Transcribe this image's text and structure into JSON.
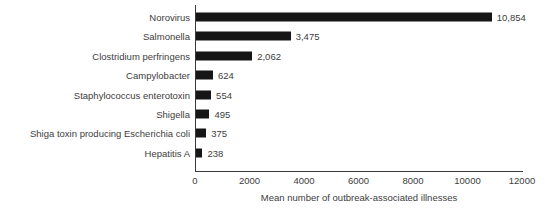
{
  "chart_data": {
    "type": "bar",
    "orientation": "horizontal",
    "title": "",
    "xlabel": "Mean number of outbreak-associated illnesses",
    "ylabel": "",
    "xlim": [
      0,
      12000
    ],
    "xticks": [
      0,
      2000,
      4000,
      6000,
      8000,
      10000,
      12000
    ],
    "xtick_labels": [
      "0",
      "2000",
      "4000",
      "6000",
      "8000",
      "10000",
      "12000"
    ],
    "grid": false,
    "legend": false,
    "bar_color": "#161616",
    "text_color": "#3d3d3d",
    "axis_color": "#3a3a3a",
    "background": "#ffffff",
    "categories": [
      "Norovirus",
      "Salmonella",
      "Clostridium perfringens",
      "Campylobacter",
      "Staphylococcus enterotoxin",
      "Shigella",
      "Shiga toxin producing Escherichia coli",
      "Hepatitis A"
    ],
    "values": [
      10854,
      3475,
      2062,
      624,
      554,
      495,
      375,
      238
    ],
    "value_labels": [
      "10,854",
      "3,475",
      "2,062",
      "624",
      "554",
      "495",
      "375",
      "238"
    ],
    "bars": [
      {
        "category": "Norovirus",
        "value": 10854,
        "value_label": "10,854"
      },
      {
        "category": "Salmonella",
        "value": 3475,
        "value_label": "3,475"
      },
      {
        "category": "Clostridium perfringens",
        "value": 2062,
        "value_label": "2,062"
      },
      {
        "category": "Campylobacter",
        "value": 624,
        "value_label": "624"
      },
      {
        "category": "Staphylococcus enterotoxin",
        "value": 554,
        "value_label": "554"
      },
      {
        "category": "Shigella",
        "value": 495,
        "value_label": "495"
      },
      {
        "category": "Shiga toxin producing Escherichia coli",
        "value": 375,
        "value_label": "375"
      },
      {
        "category": "Hepatitis A",
        "value": 238,
        "value_label": "238"
      }
    ]
  }
}
